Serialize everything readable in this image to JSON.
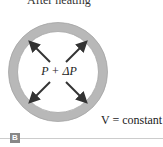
{
  "diagram": {
    "caption": "After heating",
    "pressure_label": "P + ΔP",
    "volume_label": "V = constant",
    "section_badge": "B",
    "colors": {
      "ring": "#b5b5b5",
      "ring_edge": "#a0a0a0",
      "arrow": "#333333",
      "badge": "#888888"
    },
    "arrows": [
      "up-left",
      "up-right",
      "down-left",
      "down-right"
    ]
  }
}
